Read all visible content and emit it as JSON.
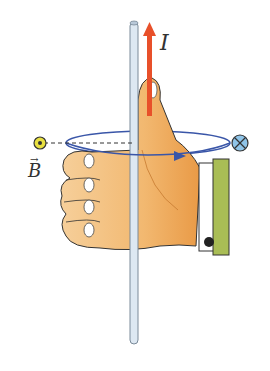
{
  "labels": {
    "current": "I",
    "field": "B",
    "field_vector_mark": "→"
  },
  "symbols": {
    "out_of_page": "dot-in-circle",
    "into_page": "cross-in-circle"
  },
  "colors": {
    "current_arrow": "#e8502a",
    "field_loop": "#3a56a8",
    "wire": "#dde8f2",
    "wire_outline": "#7a8a99",
    "hand": "#f2b870",
    "hand_shadow": "#e99a46",
    "out_symbol": "#e8e040",
    "in_symbol": "#8fc4e8",
    "battery_plate": "#a9bd55"
  }
}
